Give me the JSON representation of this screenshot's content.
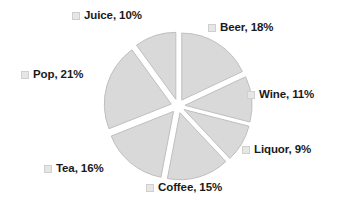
{
  "chart_data": {
    "type": "pie",
    "title": "",
    "exploded": true,
    "start_angle_deg": 0,
    "direction": "clockwise",
    "legend": "none",
    "grid": false,
    "label_format": "{name}, {percent}%",
    "categories": [
      "Beer",
      "Wine",
      "Liquor",
      "Coffee",
      "Tea",
      "Pop",
      "Juice"
    ],
    "values": [
      18,
      11,
      9,
      15,
      16,
      21,
      10
    ],
    "slices": [
      {
        "name": "Beer",
        "percent": 18,
        "label": "Beer, 18%",
        "color": "#d9d9d9"
      },
      {
        "name": "Wine",
        "percent": 11,
        "label": "Wine, 11%",
        "color": "#d9d9d9"
      },
      {
        "name": "Liquor",
        "percent": 9,
        "label": "Liquor, 9%",
        "color": "#d9d9d9"
      },
      {
        "name": "Coffee",
        "percent": 15,
        "label": "Coffee, 15%",
        "color": "#d9d9d9"
      },
      {
        "name": "Tea",
        "percent": 16,
        "label": "Tea, 16%",
        "color": "#d9d9d9"
      },
      {
        "name": "Pop",
        "percent": 21,
        "label": "Pop, 21%",
        "color": "#d9d9d9"
      },
      {
        "name": "Juice",
        "percent": 10,
        "label": "Juice, 10%",
        "color": "#d9d9d9"
      }
    ],
    "colors": {
      "slice_fill": "#d9d9d9",
      "slice_stroke": "#bfbfbf",
      "label_text": "#1a1a1a",
      "marker_fill": "#e6e6e6",
      "marker_stroke": "#cfcfcf",
      "background": "#ffffff"
    }
  },
  "labels": {
    "beer": "Beer, 18%",
    "wine": "Wine, 11%",
    "liquor": "Liquor, 9%",
    "coffee": "Coffee, 15%",
    "tea": "Tea, 16%",
    "pop": "Pop, 21%",
    "juice": "Juice, 10%"
  }
}
